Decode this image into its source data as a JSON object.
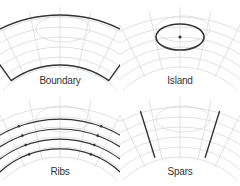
{
  "panels": [
    {
      "id": "boundary",
      "label": "Boundary",
      "highlight": "boundary"
    },
    {
      "id": "island",
      "label": "Island",
      "highlight": "island"
    },
    {
      "id": "ribs",
      "label": "Ribs",
      "highlight": "ribs",
      "rib_count": 4
    },
    {
      "id": "spars",
      "label": "Spars",
      "highlight": "spars",
      "spar_count": 2
    }
  ],
  "colors": {
    "highlight": "#333333",
    "grid": "#d9d9d9",
    "label": "#333333"
  }
}
